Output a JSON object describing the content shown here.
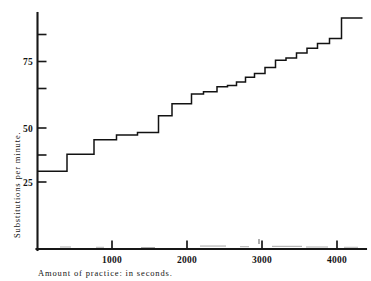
{
  "figure": {
    "name": "practice-curve-figure",
    "background": "#ffffff",
    "ink_color": "#141414"
  },
  "axes": {
    "y_axis_title": "Substitutions per minute.",
    "x_axis_title": "Amount of practice: in seconds.",
    "y_tick_labels": [
      "75",
      "50",
      "25"
    ],
    "x_tick_labels": [
      "1000",
      "2000",
      "3000",
      "4000"
    ],
    "y_unlabeled_tick_values": [
      87.5,
      62.5,
      37.5
    ],
    "y_labeled_tick_values": [
      75,
      50,
      25
    ],
    "x_tick_values": [
      1000,
      2000,
      3000,
      4000
    ]
  },
  "chart_data": {
    "type": "line",
    "subtype": "step",
    "title": "",
    "subtitle": "",
    "xlabel": "Amount of practice: in seconds.",
    "ylabel": "Substitutions per minute.",
    "xlim": [
      0,
      4400
    ],
    "ylim": [
      0,
      95
    ],
    "grid": false,
    "legend": null,
    "x_ticks": [
      1000,
      2000,
      3000,
      4000
    ],
    "y_ticks": [
      25,
      37.5,
      50,
      62.5,
      75,
      87.5
    ],
    "y_major_ticks": [
      25,
      50,
      75
    ],
    "series": [
      {
        "name": "Substitution rate",
        "step_mode": "post",
        "x": [
          0,
          400,
          400,
          760,
          760,
          1060,
          1060,
          1340,
          1340,
          1620,
          1620,
          1800,
          1800,
          2060,
          2060,
          2220,
          2220,
          2400,
          2400,
          2540,
          2540,
          2660,
          2660,
          2780,
          2780,
          2900,
          2900,
          3040,
          3040,
          3180,
          3180,
          3320,
          3320,
          3460,
          3460,
          3600,
          3600,
          3740,
          3740,
          3900,
          3900,
          4060,
          4060,
          4340
        ],
        "y": [
          29.5,
          29.5,
          36.5,
          36.5,
          42.5,
          42.5,
          44.5,
          44.5,
          45.5,
          45.5,
          52.5,
          52.5,
          57.5,
          57.5,
          61.5,
          61.5,
          62.5,
          62.5,
          64.5,
          64.5,
          65.0,
          65.0,
          66.5,
          66.5,
          68.5,
          68.5,
          70.0,
          70.0,
          72.5,
          72.5,
          75.5,
          75.5,
          76.5,
          76.5,
          78.5,
          78.5,
          80.5,
          80.5,
          82.5,
          82.5,
          84.5,
          84.5,
          93.0,
          93.0
        ],
        "points": [
          {
            "x_start": 0,
            "x_end": 400,
            "value": 29.5
          },
          {
            "x_start": 400,
            "x_end": 760,
            "value": 36.5
          },
          {
            "x_start": 760,
            "x_end": 1060,
            "value": 42.5
          },
          {
            "x_start": 1060,
            "x_end": 1340,
            "value": 44.5
          },
          {
            "x_start": 1340,
            "x_end": 1620,
            "value": 45.5
          },
          {
            "x_start": 1620,
            "x_end": 1800,
            "value": 52.5
          },
          {
            "x_start": 1800,
            "x_end": 2060,
            "value": 57.5
          },
          {
            "x_start": 2060,
            "x_end": 2220,
            "value": 61.5
          },
          {
            "x_start": 2220,
            "x_end": 2400,
            "value": 62.5
          },
          {
            "x_start": 2400,
            "x_end": 2540,
            "value": 64.5
          },
          {
            "x_start": 2540,
            "x_end": 2660,
            "value": 65.0
          },
          {
            "x_start": 2660,
            "x_end": 2780,
            "value": 66.5
          },
          {
            "x_start": 2780,
            "x_end": 2900,
            "value": 68.5
          },
          {
            "x_start": 2900,
            "x_end": 3040,
            "value": 70.0
          },
          {
            "x_start": 3040,
            "x_end": 3180,
            "value": 72.5
          },
          {
            "x_start": 3180,
            "x_end": 3320,
            "value": 75.5
          },
          {
            "x_start": 3320,
            "x_end": 3460,
            "value": 76.5
          },
          {
            "x_start": 3460,
            "x_end": 3600,
            "value": 78.5
          },
          {
            "x_start": 3600,
            "x_end": 3740,
            "value": 80.5
          },
          {
            "x_start": 3740,
            "x_end": 3900,
            "value": 82.5
          },
          {
            "x_start": 3900,
            "x_end": 4060,
            "value": 84.5
          },
          {
            "x_start": 4060,
            "x_end": 4340,
            "value": 93.0
          }
        ]
      }
    ]
  }
}
